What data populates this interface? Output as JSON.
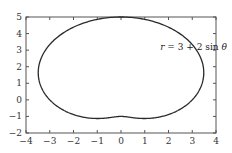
{
  "chart_data": {
    "type": "line",
    "title": "",
    "xlabel": "",
    "ylabel": "",
    "xlim": [
      -4,
      4
    ],
    "ylim": [
      -2,
      5
    ],
    "x_ticks": [
      -4,
      -3,
      -2,
      -1,
      0,
      1,
      2,
      3,
      4
    ],
    "y_ticks": [
      -2,
      -1,
      0,
      1,
      2,
      3,
      4,
      5
    ],
    "x_tick_labels": [
      "−4",
      "−3",
      "−2",
      "−1",
      "0",
      "1",
      "2",
      "3",
      "4"
    ],
    "y_tick_labels": [
      "−2",
      "−1",
      "0",
      "1",
      "2",
      "3",
      "4",
      "5"
    ],
    "grid": false,
    "legend": null,
    "series": [
      {
        "name": "r = 3 + 2 sin θ",
        "kind": "polar",
        "equation": {
          "a": 3,
          "b": 2,
          "func": "sin"
        },
        "color": "#2a2a2a",
        "sample_points": [
          {
            "theta_deg": 0,
            "x": 3.0,
            "y": 0.0
          },
          {
            "theta_deg": 45,
            "x": 3.12,
            "y": 3.12
          },
          {
            "theta_deg": 90,
            "x": 0.0,
            "y": 5.0
          },
          {
            "theta_deg": 135,
            "x": -3.12,
            "y": 3.12
          },
          {
            "theta_deg": 180,
            "x": -3.0,
            "y": 0.0
          },
          {
            "theta_deg": 225,
            "x": -1.12,
            "y": -1.12
          },
          {
            "theta_deg": 270,
            "x": 0.0,
            "y": -1.0
          },
          {
            "theta_deg": 315,
            "x": 1.12,
            "y": -1.12
          }
        ]
      }
    ],
    "annotations": [
      {
        "text_prefix": "r",
        "text_mid": " = 3 + 2 sin ",
        "text_suffix": "θ",
        "x": 1.65,
        "y": 3.0
      }
    ]
  }
}
